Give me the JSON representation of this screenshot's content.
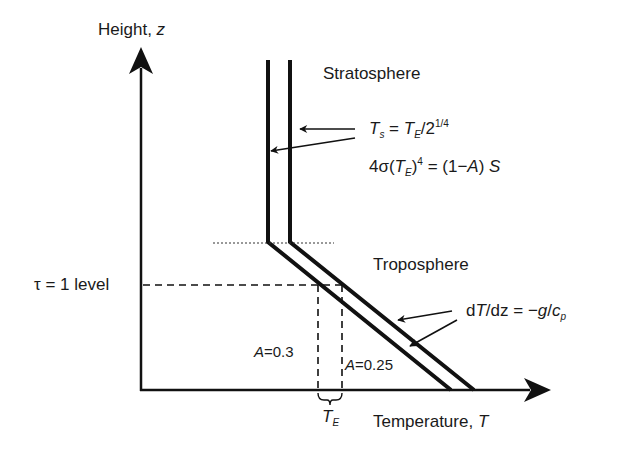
{
  "diagram": {
    "y_axis_label": {
      "text": "Height, ",
      "var": "z"
    },
    "x_axis_label": {
      "text": "Temperature, ",
      "var": "T"
    },
    "regions": {
      "stratosphere": "Stratosphere",
      "troposphere": "Troposphere"
    },
    "tau_level": "τ = 1 level",
    "equations": {
      "stratosphere_temp": {
        "lhs": "T",
        "lhs_sub": "s",
        "eq": " = ",
        "rhs": "T",
        "rhs_sub": "E",
        "rest": "/2",
        "sup": "1/4"
      },
      "energy_balance": {
        "pre": "4σ(",
        "var": "T",
        "sub": "E",
        "post": ")",
        "sup": "4",
        "rhs": " = (1−",
        "A": "A",
        "close": ") ",
        "S": "S"
      },
      "lapse_rate": {
        "d": "d",
        "T": "T",
        "slash": "/dz = −",
        "g": "g",
        "slash2": "/",
        "c": "c",
        "sub": "p"
      }
    },
    "albedo_labels": {
      "left": {
        "A": "A",
        "val": "=0.3"
      },
      "right": {
        "A": "A",
        "val": "=0.25"
      }
    },
    "te_label": {
      "var": "T",
      "sub": "E"
    },
    "colors": {
      "line": "#111111",
      "text": "#1a1a1a",
      "background": "#ffffff"
    }
  }
}
